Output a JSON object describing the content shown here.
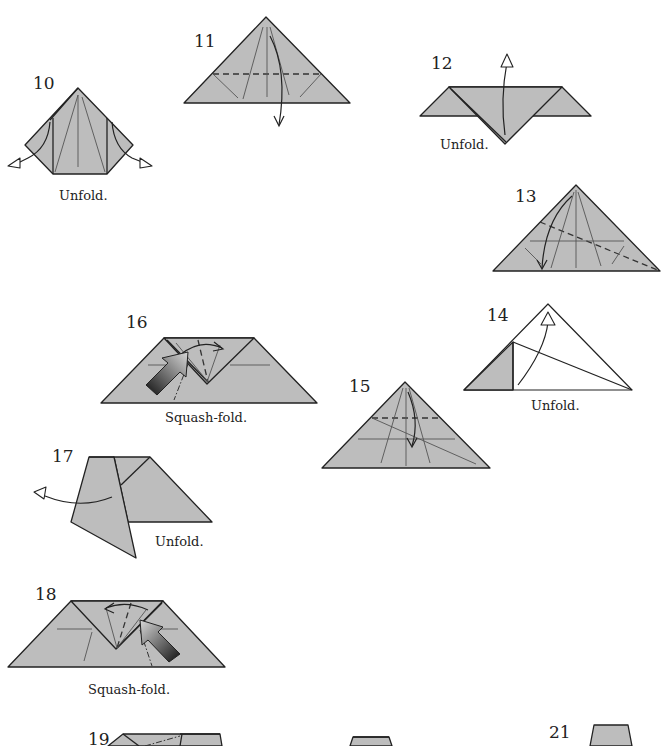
{
  "page": {
    "type": "origami-instruction-diagrams",
    "paper_color": "#bdbdbd",
    "line_color": "#222222"
  },
  "steps": [
    {
      "number": "10",
      "caption": "Unfold.",
      "icons": [
        "valley-fold-arrows-out"
      ]
    },
    {
      "number": "11",
      "caption": "",
      "icons": [
        "valley-fold-line",
        "fold-down-arrow"
      ]
    },
    {
      "number": "12",
      "caption": "Unfold.",
      "icons": [
        "unfold-up-arrow"
      ]
    },
    {
      "number": "13",
      "caption": "",
      "icons": [
        "valley-fold-line",
        "fold-down-arrow"
      ]
    },
    {
      "number": "14",
      "caption": "Unfold.",
      "icons": [
        "unfold-up-arrow"
      ]
    },
    {
      "number": "15",
      "caption": "",
      "icons": [
        "valley-fold-line",
        "fold-down-arrow"
      ]
    },
    {
      "number": "16",
      "caption": "Squash-fold.",
      "icons": [
        "push-arrow",
        "swing-arrow"
      ]
    },
    {
      "number": "17",
      "caption": "Unfold.",
      "icons": [
        "unfold-left-arrow"
      ]
    },
    {
      "number": "18",
      "caption": "Squash-fold.",
      "icons": [
        "push-arrow",
        "swing-arrow"
      ]
    },
    {
      "number": "19",
      "caption": "",
      "icons": []
    },
    {
      "number": "20",
      "caption": "",
      "icons": []
    },
    {
      "number": "21",
      "caption": "",
      "icons": []
    }
  ]
}
